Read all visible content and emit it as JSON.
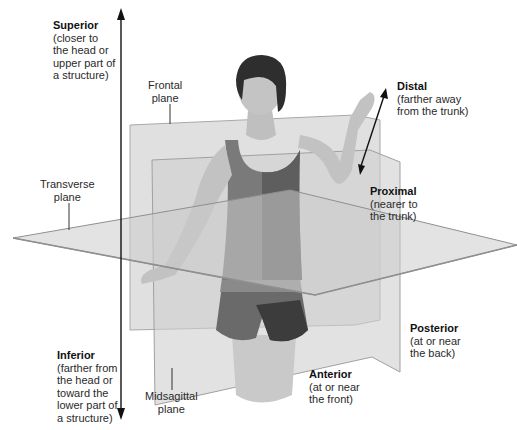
{
  "labels": {
    "superior": {
      "title": "Superior",
      "lines": [
        "(closer to",
        "the head or",
        "upper part of",
        "a structure)"
      ]
    },
    "inferior": {
      "title": "Inferior",
      "lines": [
        "(farther from",
        "the head or",
        "toward the",
        "lower part of",
        "a structure)"
      ]
    },
    "distal": {
      "title": "Distal",
      "lines": [
        "(farther away",
        "from the trunk)"
      ]
    },
    "proximal": {
      "title": "Proximal",
      "lines": [
        "(nearer to",
        "the trunk)"
      ]
    },
    "posterior": {
      "title": "Posterior",
      "lines": [
        "(at or near",
        "the back)"
      ]
    },
    "anterior": {
      "title": "Anterior",
      "lines": [
        "(at or near",
        "the front)"
      ]
    },
    "frontal_plane": {
      "lines": [
        "Frontal",
        "plane"
      ]
    },
    "transverse_plane": {
      "lines": [
        "Transverse",
        "plane"
      ]
    },
    "midsagittal_plane": {
      "lines": [
        "Midsagittal",
        "plane"
      ]
    }
  },
  "colors": {
    "plane_fill": "#c8c8c8",
    "plane_edge": "#9a9a9a",
    "arrow": "#111111",
    "tank_top": "#6e6e6e",
    "shorts": "#555555",
    "skin": "#bdbdbd",
    "hair": "#2b2b2b"
  }
}
